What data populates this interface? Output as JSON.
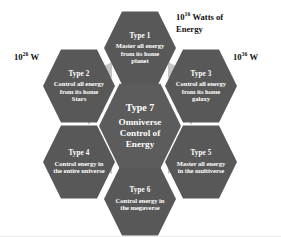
{
  "diagram": {
    "center": {
      "title": "Type 7",
      "description": "Omniverse Control of Energy"
    },
    "petals": [
      {
        "id": "type-1",
        "title": "Type 1",
        "description": "Master all energy from its home planet"
      },
      {
        "id": "type-3",
        "title": "Type 3",
        "description": "Control all energy from its home galaxy"
      },
      {
        "id": "type-5",
        "title": "Type 5",
        "description": "Master all energy in the multiverse"
      },
      {
        "id": "type-6",
        "title": "Type 6",
        "description": "Control energy in the megaverse"
      },
      {
        "id": "type-4",
        "title": "Type 4",
        "description": "Control energy in the entire universe"
      },
      {
        "id": "type-2",
        "title": "Type 2",
        "description": "Control all energy from its home Stars"
      }
    ],
    "annotations": [
      {
        "id": "annotation-top-right",
        "base": "10",
        "exponent": "16",
        "suffix": " Watts of Energy"
      },
      {
        "id": "annotation-left",
        "base": "10",
        "exponent": "26",
        "suffix": " W"
      },
      {
        "id": "annotation-right",
        "base": "10",
        "exponent": "36",
        "suffix": " W"
      }
    ],
    "colors": {
      "hex_fill": "#585858",
      "hex_center_fill": "#5c5c5c",
      "connector_fill": "#c6c6c6",
      "text_on_hex": "#ffffff",
      "annotation_text": "#111111",
      "background": "#ffffff"
    }
  }
}
